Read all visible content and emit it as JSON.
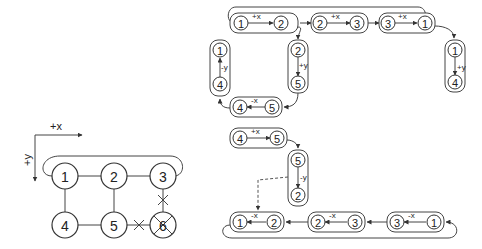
{
  "grid": {
    "axis_x": "+x",
    "axis_y": "+y",
    "nodes": [
      "1",
      "2",
      "3",
      "4",
      "5",
      "6"
    ],
    "failed_node": "6"
  },
  "moves": [
    {
      "from": "1",
      "to": "2",
      "dir": "+x"
    },
    {
      "from": "2",
      "to": "3",
      "dir": "+x"
    },
    {
      "from": "3",
      "to": "1",
      "dir": "+x"
    },
    {
      "from": "1",
      "to": "4",
      "dir": "+y"
    },
    {
      "from": "2",
      "to": "5",
      "dir": "+y"
    },
    {
      "from": "4",
      "to": "5",
      "dir": "+x"
    },
    {
      "from": "5",
      "to": "4",
      "dir": "-x"
    },
    {
      "from": "4",
      "to": "1",
      "dir": "-y"
    },
    {
      "from": "5",
      "to": "2",
      "dir": "-y"
    },
    {
      "from": "1",
      "to": "2",
      "dir": "-x",
      "rev": true
    },
    {
      "from": "2",
      "to": "3",
      "dir": "-x",
      "rev": true
    },
    {
      "from": "3",
      "to": "1",
      "dir": "-x",
      "rev": true
    }
  ]
}
